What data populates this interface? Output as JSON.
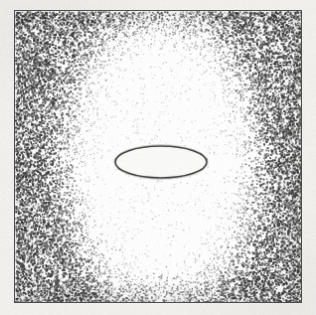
{
  "figure": {
    "title": "Stippled field with central highlighted oval and outlined inner ellipse",
    "caption": "",
    "medium": "scanned halftone / stipple print",
    "canvas": {
      "width": 316,
      "height": 315
    },
    "background_color": "#f2f1ee",
    "paper_color": "#ffffff"
  },
  "frame": {
    "name": "plate-border",
    "x": 14,
    "y": 10,
    "width": 288,
    "height": 293,
    "border_color": "#4a4a48",
    "border_width": 1.5,
    "fill_color": "#ffffff"
  },
  "stipple_field": {
    "name": "stipple-noise-field",
    "outer_dot_color": "#3a3a3a",
    "outer_mean_gray": "#9a9a98",
    "inner_mean_gray": "#fbfbfa",
    "outer_density": 0.52,
    "inner_density": 0.055,
    "dot_size_px": 1.35,
    "description": "Dense random stipple at the plate edges fading smoothly to sparse dots inside a large vertical oval."
  },
  "light_oval": {
    "name": "inner-light-oval",
    "center_x": 160,
    "center_y": 160,
    "radius_x": 72,
    "radius_y": 112,
    "falloff_px": 42,
    "fill_color": "#fcfcfb",
    "description": "Tall light oval region of reduced stipple density centered in the plate."
  },
  "center_ellipse": {
    "name": "center-outlined-ellipse",
    "center_x": 161,
    "center_y": 162,
    "radius_x": 46,
    "radius_y": 16,
    "fill_color": "#fbfbfa",
    "stroke_color": "#3c3c3a",
    "stroke_width": 1.6,
    "description": "Small horizontal ellipse with a dark outline and clean white interior at the figure center."
  },
  "colors": {
    "ink": "#3a3a3a",
    "border": "#4a4a48",
    "paper": "#ffffff",
    "mount": "#f2f1ee",
    "mid_gray": "#9a9a98"
  },
  "labels": {
    "none": ""
  }
}
